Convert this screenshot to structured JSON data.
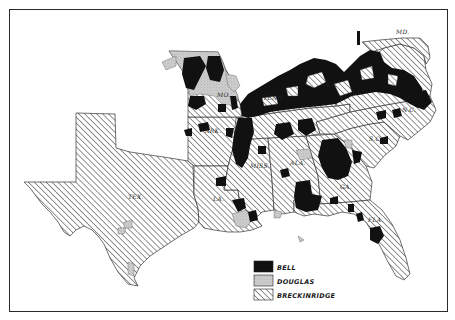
{
  "map": {
    "title": "",
    "region": "Southern United States",
    "frame": true
  },
  "state_labels": [
    {
      "id": "tex",
      "text": "TEX.",
      "x": 128,
      "y": 199
    },
    {
      "id": "ark",
      "text": "ARK.",
      "x": 205,
      "y": 133
    },
    {
      "id": "la",
      "text": "LA.",
      "x": 213,
      "y": 201
    },
    {
      "id": "miss",
      "text": "MISS.",
      "x": 250,
      "y": 168
    },
    {
      "id": "ala",
      "text": "ALA.",
      "x": 290,
      "y": 165
    },
    {
      "id": "ga",
      "text": "GA.",
      "x": 340,
      "y": 189
    },
    {
      "id": "fla",
      "text": "FLA.",
      "x": 368,
      "y": 222
    },
    {
      "id": "sc",
      "text": "S.C.",
      "x": 369,
      "y": 141
    },
    {
      "id": "nc",
      "text": "N.C.",
      "x": 402,
      "y": 112
    },
    {
      "id": "va",
      "text": "VA.",
      "x": 352,
      "y": 95
    },
    {
      "id": "ky",
      "text": "KY.",
      "x": 326,
      "y": 87
    },
    {
      "id": "tenn",
      "text": "TENN.",
      "x": 263,
      "y": 100
    },
    {
      "id": "mo",
      "text": "MO.",
      "x": 217,
      "y": 97
    },
    {
      "id": "md",
      "text": "MD.",
      "x": 396,
      "y": 34
    }
  ],
  "legend": {
    "items": [
      {
        "label": "BELL",
        "fill": "#111111",
        "pattern": "solid"
      },
      {
        "label": "DOUGLAS",
        "fill": "#c8c8c8",
        "pattern": "stipple"
      },
      {
        "label": "BRECKINRIDGE",
        "fill": "#ffffff",
        "pattern": "hatch"
      }
    ]
  },
  "colors": {
    "bell": "#111111",
    "douglas": "#c6c6c6",
    "breckinridge_line": "#3a3a3a",
    "border": "#2a2a2a",
    "background": "#ffffff"
  }
}
